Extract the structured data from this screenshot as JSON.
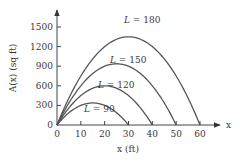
{
  "chart_data": {
    "type": "line",
    "title": "",
    "xlabel": "x (ft)",
    "ylabel": "A(x) (sq ft)",
    "x_axis_symbol": "x",
    "xlim": [
      0,
      60
    ],
    "ylim": [
      0,
      1500
    ],
    "xticks": [
      0,
      10,
      20,
      30,
      40,
      50,
      60
    ],
    "yticks": [
      0,
      300,
      600,
      900,
      1200,
      1500
    ],
    "xtick_labels": [
      "0",
      "10",
      "20",
      "30",
      "40",
      "50",
      "60"
    ],
    "ytick_labels": [
      "0",
      "300",
      "600",
      "900",
      "1200",
      "1500"
    ],
    "grid": false,
    "legend": "inline curve labels",
    "formula": "A(x) = x(L - 3x)/2",
    "series": [
      {
        "name": "L = 90",
        "L": 90,
        "zero_at": 30,
        "max_x": 15,
        "max_y": 337.5
      },
      {
        "name": "L = 120",
        "L": 120,
        "zero_at": 40,
        "max_x": 20,
        "max_y": 600
      },
      {
        "name": "L = 150",
        "L": 150,
        "zero_at": 50,
        "max_x": 25,
        "max_y": 937.5
      },
      {
        "name": "L = 180",
        "L": 180,
        "zero_at": 60,
        "max_x": 30,
        "max_y": 1350
      }
    ],
    "colors": {
      "curve": "#555555",
      "axis": "#444444",
      "text": "#3a3a3a"
    }
  }
}
